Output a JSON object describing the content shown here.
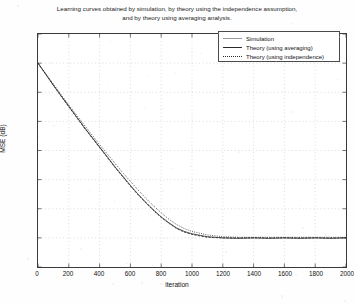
{
  "chart_data": {
    "type": "line",
    "title": "Learning curves obtained by simulation, by theory using the independence assumption, and by theory using averaging analysis.",
    "title_line1": "Learning curves obtained by simulation, by theory using the independence assumption,",
    "title_line2": "and by theory using averaging analysis.",
    "xlabel": "iteration",
    "ylabel": "MSE (dB)",
    "xlim": [
      0,
      2000
    ],
    "ylim": [
      -35,
      5
    ],
    "xticks": [
      0,
      200,
      400,
      600,
      800,
      1000,
      1200,
      1400,
      1600,
      1800,
      2000
    ],
    "yticks": [
      5,
      0,
      -5,
      -10,
      -15,
      -20,
      -25,
      -30,
      -35
    ],
    "grid": true,
    "grid_style": "dotted",
    "legend_position": "top-right",
    "legend": [
      "Simulation",
      "Theory (using averaging)",
      "Theory (using independence)"
    ],
    "x": [
      0,
      50,
      100,
      150,
      200,
      250,
      300,
      350,
      400,
      450,
      500,
      550,
      600,
      650,
      700,
      750,
      800,
      850,
      900,
      950,
      1000,
      1100,
      1200,
      1300,
      1400,
      1500,
      1600,
      1700,
      1800,
      1900,
      2000
    ],
    "series": [
      {
        "name": "Simulation",
        "style": "solid",
        "color": "#2b2b2b",
        "values": [
          0.0,
          -1.9,
          -3.8,
          -5.6,
          -7.4,
          -9.2,
          -11.0,
          -12.7,
          -14.4,
          -16.1,
          -17.8,
          -19.4,
          -21.0,
          -22.5,
          -23.9,
          -25.2,
          -26.4,
          -27.4,
          -28.3,
          -28.9,
          -29.3,
          -29.8,
          -30.0,
          -30.1,
          -30.0,
          -30.1,
          -30.0,
          -30.1,
          -30.0,
          -30.1,
          -30.0
        ]
      },
      {
        "name": "Theory (using averaging)",
        "style": "dashed",
        "color": "#2b2b2b",
        "values": [
          0.0,
          -1.9,
          -3.8,
          -5.7,
          -7.5,
          -9.3,
          -11.1,
          -12.8,
          -14.5,
          -16.2,
          -17.9,
          -19.5,
          -21.1,
          -22.6,
          -24.0,
          -25.3,
          -26.5,
          -27.5,
          -28.4,
          -29.0,
          -29.4,
          -29.9,
          -30.0,
          -30.0,
          -30.0,
          -30.0,
          -30.0,
          -30.0,
          -30.0,
          -30.0,
          -30.0
        ]
      },
      {
        "name": "Theory (using independence)",
        "style": "dotted",
        "color": "#2b2b2b",
        "values": [
          0.0,
          -1.8,
          -3.6,
          -5.4,
          -7.2,
          -8.9,
          -10.6,
          -12.3,
          -14.0,
          -15.6,
          -17.2,
          -18.8,
          -20.3,
          -21.8,
          -23.2,
          -24.5,
          -25.7,
          -26.8,
          -27.7,
          -28.4,
          -28.9,
          -29.5,
          -29.8,
          -29.9,
          -29.9,
          -29.9,
          -29.9,
          -29.9,
          -29.9,
          -29.9,
          -29.9
        ]
      }
    ]
  }
}
